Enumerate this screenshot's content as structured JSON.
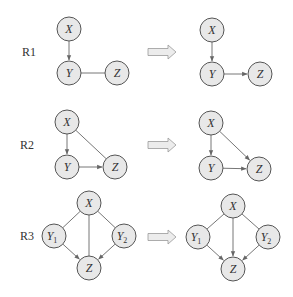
{
  "rules": [
    {
      "label": "R1",
      "before": {
        "nodes": [
          {
            "id": "X",
            "label": "X",
            "x": 69,
            "y": 29
          },
          {
            "id": "Y",
            "label": "Y",
            "x": 69,
            "y": 73
          },
          {
            "id": "Z",
            "label": "Z",
            "x": 117,
            "y": 73
          }
        ],
        "edges": [
          {
            "from": "X",
            "to": "Y",
            "directed": true
          },
          {
            "from": "Y",
            "to": "Z",
            "directed": false
          }
        ]
      },
      "after": {
        "nodes": [
          {
            "id": "X",
            "label": "X",
            "x": 212,
            "y": 30
          },
          {
            "id": "Y",
            "label": "Y",
            "x": 212,
            "y": 74
          },
          {
            "id": "Z",
            "label": "Z",
            "x": 260,
            "y": 74
          }
        ],
        "edges": [
          {
            "from": "X",
            "to": "Y",
            "directed": true
          },
          {
            "from": "Y",
            "to": "Z",
            "directed": true
          }
        ]
      },
      "label_pos": {
        "x": 22,
        "y": 56
      },
      "arrow_y": 52
    },
    {
      "label": "R2",
      "before": {
        "nodes": [
          {
            "id": "X",
            "label": "X",
            "x": 67,
            "y": 122
          },
          {
            "id": "Y",
            "label": "Y",
            "x": 67,
            "y": 167
          },
          {
            "id": "Z",
            "label": "Z",
            "x": 115,
            "y": 167
          }
        ],
        "edges": [
          {
            "from": "X",
            "to": "Y",
            "directed": true
          },
          {
            "from": "X",
            "to": "Z",
            "directed": false
          },
          {
            "from": "Y",
            "to": "Z",
            "directed": true
          }
        ]
      },
      "after": {
        "nodes": [
          {
            "id": "X",
            "label": "X",
            "x": 211,
            "y": 123
          },
          {
            "id": "Y",
            "label": "Y",
            "x": 211,
            "y": 168
          },
          {
            "id": "Z",
            "label": "Z",
            "x": 259,
            "y": 169
          }
        ],
        "edges": [
          {
            "from": "X",
            "to": "Y",
            "directed": true
          },
          {
            "from": "X",
            "to": "Z",
            "directed": true
          },
          {
            "from": "Y",
            "to": "Z",
            "directed": true
          }
        ]
      },
      "label_pos": {
        "x": 20,
        "y": 149
      },
      "arrow_y": 145
    },
    {
      "label": "R3",
      "before": {
        "nodes": [
          {
            "id": "X",
            "label": "X",
            "x": 89,
            "y": 203
          },
          {
            "id": "Y1",
            "label": "Y",
            "sub": "1",
            "x": 54,
            "y": 236
          },
          {
            "id": "Y2",
            "label": "Y",
            "sub": "2",
            "x": 124,
            "y": 236
          },
          {
            "id": "Z",
            "label": "Z",
            "x": 89,
            "y": 268
          }
        ],
        "edges": [
          {
            "from": "X",
            "to": "Y1",
            "directed": false
          },
          {
            "from": "X",
            "to": "Y2",
            "directed": false
          },
          {
            "from": "X",
            "to": "Z",
            "directed": false
          },
          {
            "from": "Y1",
            "to": "Z",
            "directed": true
          },
          {
            "from": "Y2",
            "to": "Z",
            "directed": true
          }
        ]
      },
      "after": {
        "nodes": [
          {
            "id": "X",
            "label": "X",
            "x": 233,
            "y": 206
          },
          {
            "id": "Y1",
            "label": "Y",
            "sub": "1",
            "x": 198,
            "y": 237
          },
          {
            "id": "Y2",
            "label": "Y",
            "sub": "2",
            "x": 268,
            "y": 237
          },
          {
            "id": "Z",
            "label": "Z",
            "x": 233,
            "y": 269
          }
        ],
        "edges": [
          {
            "from": "X",
            "to": "Y1",
            "directed": false
          },
          {
            "from": "X",
            "to": "Y2",
            "directed": false
          },
          {
            "from": "X",
            "to": "Z",
            "directed": true
          },
          {
            "from": "Y1",
            "to": "Z",
            "directed": true
          },
          {
            "from": "Y2",
            "to": "Z",
            "directed": true
          }
        ]
      },
      "label_pos": {
        "x": 20,
        "y": 240
      },
      "arrow_y": 237
    }
  ],
  "node_radius": 12,
  "transform_arrow": {
    "x1": 148,
    "x2": 176
  },
  "colors": {
    "node_fill": "#e8e8e8",
    "node_stroke": "#555555",
    "edge": "#666666"
  }
}
